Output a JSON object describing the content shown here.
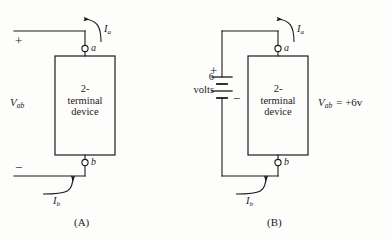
{
  "figure": {
    "background_color": "#fdfdfc",
    "ink_color": "#1b1b1b"
  },
  "panel_a": {
    "caption": "(A)",
    "device_line1": "2-",
    "device_line2": "terminal",
    "device_line3": "device",
    "terminal_a_label": "a",
    "terminal_b_label": "b",
    "current_top_label": "I",
    "current_top_sub": "a",
    "current_bottom_label": "I",
    "current_bottom_sub": "b",
    "voltage_label": "V",
    "voltage_sub": "ab",
    "plus_sign": "+",
    "minus_sign": "−"
  },
  "panel_b": {
    "caption": "(B)",
    "device_line1": "2-",
    "device_line2": "terminal",
    "device_line3": "device",
    "terminal_a_label": "a",
    "terminal_b_label": "b",
    "current_top_label": "I",
    "current_top_sub": "a",
    "current_bottom_label": "I",
    "current_bottom_sub": "b",
    "source_value": "6",
    "source_unit": "volts",
    "source_plus": "+",
    "source_minus": "−",
    "voltage_label": "V",
    "voltage_sub": "ab",
    "voltage_equation": "=  +6v"
  }
}
